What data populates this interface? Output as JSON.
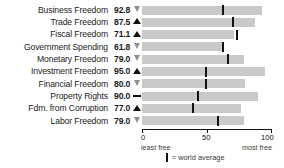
{
  "chart_data": {
    "type": "bar",
    "title": "",
    "xlabel": "",
    "ylabel": "",
    "xlim": [
      0,
      100
    ],
    "grid": false,
    "orientation": "horizontal",
    "categories": [
      "Business Freedom",
      "Trade Freedom",
      "Fiscal Freedom",
      "Government Spending",
      "Monetary Freedom",
      "Investment Freedom",
      "Financial Freedom",
      "Property Rights",
      "Fdm. from Corruption",
      "Labor Freedom"
    ],
    "values": [
      92.8,
      87.5,
      71.1,
      61.8,
      79.0,
      95.0,
      80.0,
      90.0,
      77.0,
      79.0
    ],
    "value_labels": [
      "92.8",
      "87.5",
      "71.1",
      "61.8",
      "79.0",
      "95.0",
      "80.0",
      "90.0",
      "77.0",
      "79.0"
    ],
    "trend_markers": [
      "down",
      "up",
      "up",
      "down",
      "down",
      "up",
      "down",
      "flat",
      "up",
      "down"
    ],
    "series": [
      {
        "name": "score",
        "values": [
          92.8,
          87.5,
          71.1,
          61.8,
          79.0,
          95.0,
          80.0,
          90.0,
          77.0,
          79.0
        ]
      },
      {
        "name": "world average",
        "values": [
          62,
          70,
          73,
          62,
          66,
          49,
          49,
          43,
          39,
          58
        ]
      }
    ],
    "bar_color": "#c9c9c9",
    "marker_color": "#111111",
    "axis_ticks": [
      {
        "value": 0,
        "label": "0"
      },
      {
        "value": 50,
        "label": "50"
      },
      {
        "value": 100,
        "label": "100"
      }
    ],
    "axis_end_labels": {
      "left": "least free",
      "right": "most free"
    },
    "legend": {
      "position": "bottom",
      "entries": [
        {
          "symbol": "vertical-tick",
          "label": "= world average"
        }
      ]
    }
  }
}
